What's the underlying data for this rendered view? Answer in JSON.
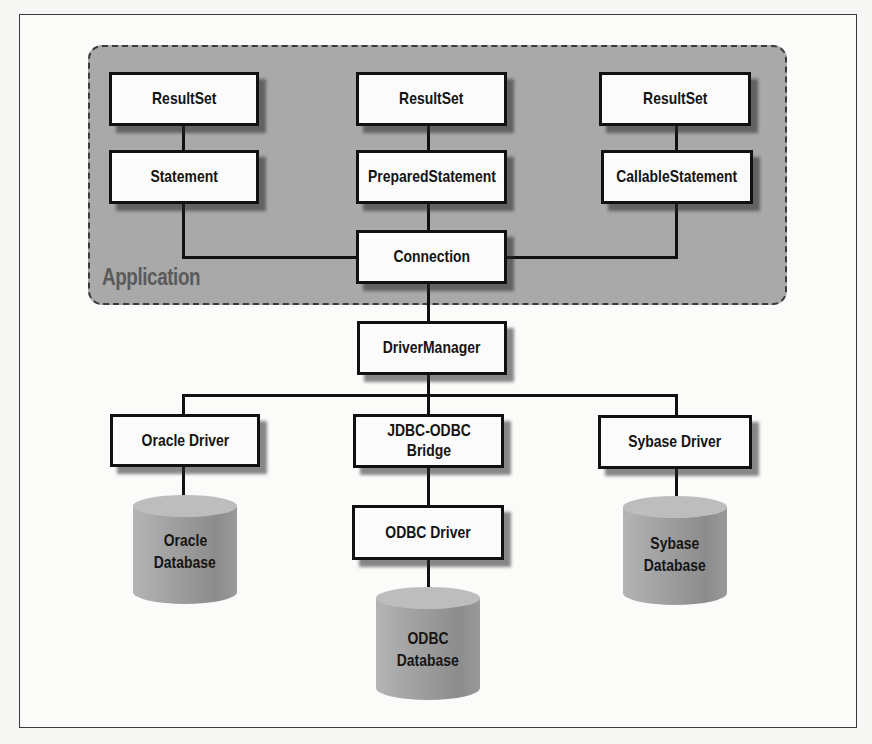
{
  "diagram": {
    "region": {
      "label": "Application",
      "fill": "#a9a9a9"
    },
    "application_nodes": {
      "resultset_left": "ResultSet",
      "resultset_middle": "ResultSet",
      "resultset_right": "ResultSet",
      "statement": "Statement",
      "prepared_statement": "PreparedStatement",
      "callable_statement": "CallableStatement",
      "connection": "Connection"
    },
    "driver_manager": "DriverManager",
    "drivers": {
      "oracle": "Oracle Driver",
      "bridge_line1": "JDBC-ODBC",
      "bridge_line2": "Bridge",
      "sybase": "Sybase Driver",
      "odbc": "ODBC Driver"
    },
    "databases": {
      "oracle": {
        "line1": "Oracle",
        "line2": "Database"
      },
      "sybase": {
        "line1": "Sybase",
        "line2": "Database"
      },
      "odbc": {
        "line1": "ODBC",
        "line2": "Database"
      }
    },
    "edges": [
      [
        "ResultSet",
        "Statement"
      ],
      [
        "ResultSet",
        "PreparedStatement"
      ],
      [
        "ResultSet",
        "CallableStatement"
      ],
      [
        "Statement",
        "Connection"
      ],
      [
        "PreparedStatement",
        "Connection"
      ],
      [
        "CallableStatement",
        "Connection"
      ],
      [
        "Connection",
        "DriverManager"
      ],
      [
        "DriverManager",
        "Oracle Driver"
      ],
      [
        "DriverManager",
        "JDBC-ODBC Bridge"
      ],
      [
        "DriverManager",
        "Sybase Driver"
      ],
      [
        "Oracle Driver",
        "Oracle Database"
      ],
      [
        "JDBC-ODBC Bridge",
        "ODBC Driver"
      ],
      [
        "ODBC Driver",
        "ODBC Database"
      ],
      [
        "Sybase Driver",
        "Sybase Database"
      ]
    ]
  }
}
